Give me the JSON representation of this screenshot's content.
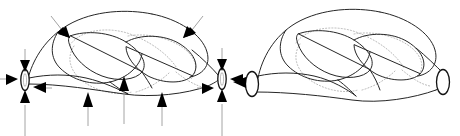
{
  "figure": {
    "background_color": "#ffffff",
    "stroke_color": "#262626",
    "hidden_line_color": "#b9b9b9",
    "arrow_color": "#000000",
    "arrow_shaft_color": "#9a9a9a",
    "panel_count": 2,
    "panels": [
      {
        "id": "left-panel",
        "label": "pinched-ends-knot-with-compression-arrows",
        "description": "Knotted tube with two narrow pinched end caps, surrounded by inward pointing arrows",
        "cap_count": 2,
        "arrow_count": 12,
        "caps": [
          {
            "name": "left-pinch-cap",
            "cx": 25,
            "cy": 80,
            "rx": 4.2,
            "ry": 10.5
          },
          {
            "name": "right-pinch-cap",
            "cx": 222,
            "cy": 79,
            "rx": 4.2,
            "ry": 10.5
          }
        ],
        "arrows": [
          {
            "name": "arrow-left-cap-top",
            "direction": "down",
            "tip_x": 25,
            "tip_y": 70,
            "tail_x": 25,
            "tail_y": 49
          },
          {
            "name": "arrow-left-cap-bottom",
            "direction": "up",
            "tip_x": 25,
            "tip_y": 92,
            "tail_x": 25,
            "tail_y": 136
          },
          {
            "name": "arrow-left-cap-left",
            "direction": "right",
            "tip_x": 17,
            "tip_y": 79,
            "tail_x": 0,
            "tail_y": 79
          },
          {
            "name": "arrow-left-cap-right",
            "direction": "left",
            "tip_x": 34,
            "tip_y": 87,
            "tail_x": 51,
            "tail_y": 87
          },
          {
            "name": "arrow-right-cap-top",
            "direction": "down",
            "tip_x": 222,
            "tip_y": 69,
            "tail_x": 222,
            "tail_y": 48
          },
          {
            "name": "arrow-right-cap-bottom",
            "direction": "up",
            "tip_x": 222,
            "tip_y": 91,
            "tail_x": 222,
            "tail_y": 136
          },
          {
            "name": "arrow-right-cap-left",
            "direction": "right",
            "tip_x": 214,
            "tip_y": 88,
            "tail_x": 198,
            "tail_y": 88
          },
          {
            "name": "arrow-right-cap-right",
            "direction": "left",
            "tip_x": 231,
            "tip_y": 79,
            "tail_x": 247,
            "tail_y": 79
          },
          {
            "name": "arrow-top-left-inward",
            "direction": "down-right",
            "tip_x": 66,
            "tip_y": 34,
            "tail_x": 52,
            "tail_y": 17
          },
          {
            "name": "arrow-top-right-inward",
            "direction": "down-right",
            "tip_x": 188,
            "tip_y": 34,
            "tail_x": 200,
            "tail_y": 17
          },
          {
            "name": "arrow-bottom-left-up",
            "direction": "up",
            "tip_x": 88,
            "tip_y": 92,
            "tail_x": 88,
            "tail_y": 124
          },
          {
            "name": "arrow-bottom-mid-up",
            "direction": "up",
            "tip_x": 124,
            "tip_y": 76,
            "tail_x": 124,
            "tail_y": 122
          },
          {
            "name": "arrow-bottom-right-up",
            "direction": "up",
            "tip_x": 162,
            "tip_y": 92,
            "tail_x": 162,
            "tail_y": 124
          }
        ]
      },
      {
        "id": "right-panel",
        "label": "flared-ends-knot",
        "description": "Same knotted tube with two wide flared open tube ends, one small arrow at the left opening",
        "cap_count": 2,
        "arrow_count": 1,
        "caps": [
          {
            "name": "left-flare-cap",
            "cx": 252,
            "cy": 84,
            "rx": 6.5,
            "ry": 12.5
          },
          {
            "name": "right-flare-cap",
            "cx": 443,
            "cy": 82,
            "rx": 6.5,
            "ry": 12.5
          }
        ],
        "arrows": [
          {
            "name": "arrow-left-flare-pointer",
            "direction": "left",
            "tip_x": 234,
            "tip_y": 82,
            "tail_x": 245,
            "tail_y": 82
          }
        ]
      }
    ]
  }
}
